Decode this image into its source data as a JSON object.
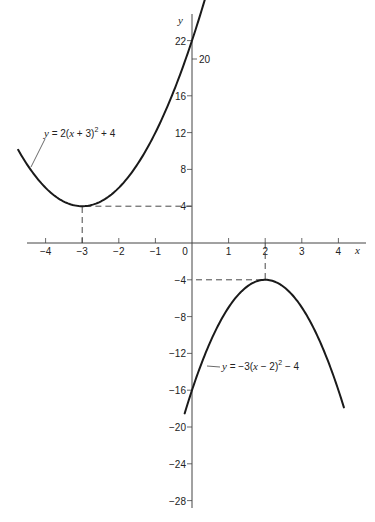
{
  "chart_data": {
    "type": "line",
    "title": "",
    "xlabel": "x",
    "ylabel": "y",
    "xlim": [
      -4.9,
      4.7
    ],
    "ylim": [
      -28.5,
      23
    ],
    "grid": false,
    "x_ticks": [
      -4,
      -3,
      -2,
      -1,
      0,
      1,
      2,
      3,
      4
    ],
    "x_tick_labels": [
      "−4",
      "−3",
      "−2",
      "−1",
      "0",
      "1",
      "2",
      "3",
      "4"
    ],
    "y_ticks": [
      22,
      20,
      16,
      12,
      8,
      4,
      -4,
      -8,
      -12,
      -16,
      -20,
      -24,
      -28
    ],
    "y_tick_labels": [
      "22",
      "20",
      "16",
      "12",
      "8",
      "4",
      "−4",
      "−8",
      "−12",
      "−16",
      "−20",
      "−24",
      "−28"
    ],
    "series": [
      {
        "name": "y = 2(x + 3)^2 + 4",
        "label_text": "y = 2(x + 3)² + 4",
        "a": 2,
        "h": -3,
        "k": 4,
        "x_range": [
          -4.75,
          0.35
        ],
        "vertex": [
          -3,
          4
        ],
        "x": [
          -4.75,
          -4.5,
          -4,
          -3.5,
          -3,
          -2.5,
          -2,
          -1.5,
          -1,
          -0.5,
          0,
          0.35
        ],
        "values": [
          10.13,
          8.5,
          6,
          4.5,
          4,
          4.5,
          6,
          8.5,
          12,
          16.5,
          22,
          26.45
        ]
      },
      {
        "name": "y = -3(x - 2)^2 - 4",
        "label_text": "y = −3(x − 2)² − 4",
        "a": -3,
        "h": 2,
        "k": -4,
        "x_range": [
          -0.2,
          4.15
        ],
        "vertex": [
          2,
          -4
        ],
        "x": [
          -0.2,
          0,
          0.5,
          1,
          1.5,
          2,
          2.5,
          3,
          3.5,
          4,
          4.15
        ],
        "values": [
          -18.52,
          -16,
          -10.75,
          -7,
          -4.75,
          -4,
          -4.75,
          -7,
          -10.75,
          -16,
          -17.87
        ]
      }
    ],
    "annotations": [
      {
        "type": "dashed-guide",
        "from": [
          -3,
          0
        ],
        "to": [
          -3,
          4
        ],
        "then_to": [
          0,
          4
        ],
        "label": "vertex (-3, 4)"
      },
      {
        "type": "dashed-guide",
        "from": [
          2,
          0
        ],
        "to": [
          2,
          -4
        ],
        "then_to": [
          0,
          -4
        ],
        "label": "vertex (2, -4)"
      }
    ],
    "layout": {
      "origin_px": [
        192,
        243
      ],
      "x_px_per_unit": 36.6,
      "y_px_per_unit": 9.2,
      "x_axis_px_range": [
        27,
        366
      ],
      "y_axis_px_range": [
        14,
        508
      ]
    }
  },
  "labels": {
    "x_axis": "x",
    "y_axis": "y",
    "eq1": {
      "pre": "y",
      "mid": " = 2(",
      "x": "x",
      "post": " + 3)",
      "sup": "2",
      "tail": " + 4"
    },
    "eq2": {
      "pre": "y",
      "mid": " = −3(",
      "x": "x",
      "post": " − 2)",
      "sup": "2",
      "tail": " − 4"
    }
  },
  "colors": {
    "curve": "#1a1a1a",
    "axis": "#444444",
    "dash": "#333333",
    "text": "#222222",
    "background": "#ffffff"
  }
}
